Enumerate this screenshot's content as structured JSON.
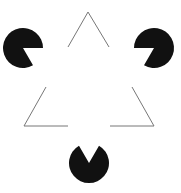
{
  "figure": {
    "background": "#ffffff",
    "pacman_color": "#111111",
    "line_color": "#777777",
    "pacmen": [
      {
        "name": "left",
        "cx": 23,
        "cy": 48,
        "r": 20
      },
      {
        "name": "right",
        "cx": 154,
        "cy": 48,
        "r": 20
      },
      {
        "name": "bottom",
        "cx": 89,
        "cy": 163,
        "r": 20
      }
    ],
    "outline_corners": [
      {
        "name": "top",
        "x": 88,
        "y": 12
      },
      {
        "name": "bottom-left",
        "x": 24,
        "y": 126
      },
      {
        "name": "bottom-right",
        "x": 154,
        "y": 126
      }
    ]
  }
}
